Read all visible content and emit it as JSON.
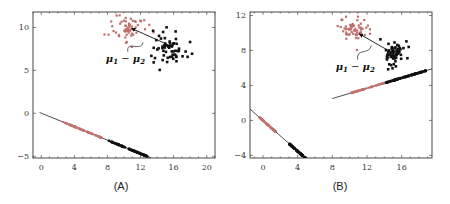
{
  "panels": [
    {
      "caption": "(A)",
      "annotation": "μ1 − μ2"
    },
    {
      "caption": "(B)",
      "annotation": "μ1 − μ2"
    }
  ],
  "colors": {
    "class1": "#c0706c",
    "class2": "#111111",
    "axis": "#333333",
    "line": "#222222"
  },
  "chart_data": [
    {
      "type": "scatter",
      "title": "(A)",
      "xlabel": "",
      "ylabel": "",
      "xlim": [
        -1,
        21
      ],
      "ylim": [
        -5.2,
        11.8
      ],
      "xticks": [
        0,
        4,
        8,
        12,
        16,
        20
      ],
      "yticks": [
        -5,
        0,
        5,
        10
      ],
      "grid": false,
      "annotations": [
        {
          "text": "μ1 − μ2",
          "x": 9.5,
          "y": 6.0,
          "arrow_to": [
            12.3,
            8.5
          ]
        }
      ],
      "series": [
        {
          "name": "class 1 (red)",
          "color": "#c0706c",
          "cluster_center": [
            10.5,
            10.0
          ],
          "cluster_spread": [
            1.2,
            1.0
          ]
        },
        {
          "name": "class 2 (black)",
          "color": "#111111",
          "cluster_center": [
            15.5,
            7.8
          ],
          "cluster_spread": [
            1.1,
            1.1
          ]
        },
        {
          "name": "mean-difference arrow",
          "from": [
            15.3,
            8.0
          ],
          "to": [
            10.9,
            9.9
          ]
        },
        {
          "name": "projection line",
          "x": [
            -0.2,
            13.3
          ],
          "y": [
            0.1,
            -5.2
          ]
        },
        {
          "name": "class 1 projections",
          "color": "#c0706c",
          "x_range": [
            2.5,
            7.5
          ],
          "along_line": true
        },
        {
          "name": "class 2 projections",
          "color": "#111111",
          "x_range": [
            8.0,
            13.0
          ],
          "along_line": true
        }
      ]
    },
    {
      "type": "scatter",
      "title": "(B)",
      "xlabel": "",
      "ylabel": "",
      "xlim": [
        -1.5,
        19.5
      ],
      "ylim": [
        -4.3,
        12.4
      ],
      "xticks": [
        0,
        4,
        8,
        12,
        16
      ],
      "yticks": [
        -4,
        0,
        4,
        8,
        12
      ],
      "grid": false,
      "annotations": [
        {
          "text": "μ1 − μ2",
          "x": 10.0,
          "y": 5.8,
          "arrow_to": [
            12.5,
            8.8
          ]
        }
      ],
      "series": [
        {
          "name": "class 1 (red)",
          "color": "#c0706c",
          "cluster_center": [
            10.5,
            10.3
          ],
          "cluster_spread": [
            1.0,
            0.9
          ]
        },
        {
          "name": "class 2 (black)",
          "color": "#111111",
          "cluster_center": [
            15.0,
            7.6
          ],
          "cluster_spread": [
            0.7,
            0.8
          ]
        },
        {
          "name": "mean-difference arrow",
          "from": [
            14.8,
            7.8
          ],
          "to": [
            11.1,
            9.9
          ]
        },
        {
          "name": "projection line (Fisher)",
          "x": [
            8.0,
            19.5
          ],
          "y": [
            2.5,
            5.9
          ]
        },
        {
          "name": "class 1 projections (Fisher)",
          "color": "#c0706c",
          "x_range": [
            10.0,
            15.0
          ],
          "along_line": true
        },
        {
          "name": "class 2 projections (Fisher)",
          "color": "#111111",
          "x_range": [
            14.0,
            19.0
          ],
          "along_line": true
        },
        {
          "name": "projection line (mean diff)",
          "x": [
            -1.5,
            5.0
          ],
          "y": [
            1.3,
            -4.4
          ]
        },
        {
          "name": "class 1 projections (mean diff)",
          "color": "#c0706c",
          "x_range": [
            -0.5,
            1.5
          ],
          "along_line": true
        },
        {
          "name": "class 2 projections (mean diff)",
          "color": "#111111",
          "x_range": [
            3.0,
            5.0
          ],
          "along_line": true
        }
      ]
    }
  ]
}
